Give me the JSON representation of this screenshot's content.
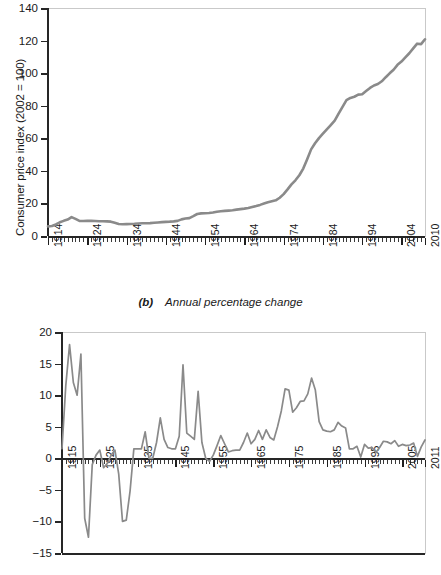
{
  "figure": {
    "panel_b_caption_prefix": "(b)",
    "panel_b_caption_text": "Annual percentage change",
    "line_color": "#8a8a8a",
    "axis_color": "#262626",
    "frame_color": "#c9c9c9"
  },
  "chart_data": [
    {
      "type": "line",
      "panel": "a",
      "title": "",
      "xlabel": "",
      "ylabel": "Consumer price index (2002 = 100)",
      "xlim": [
        1914,
        2010
      ],
      "ylim": [
        0,
        140
      ],
      "ytick_values": [
        0,
        20,
        40,
        60,
        80,
        100,
        120,
        140
      ],
      "ytick_labels": [
        "0",
        "20",
        "40",
        "60",
        "80",
        "100",
        "120",
        "140"
      ],
      "xtick_values": [
        1914,
        1924,
        1934,
        1944,
        1954,
        1964,
        1974,
        1984,
        1994,
        2004,
        2010
      ],
      "xtick_labels": [
        "1914",
        "1924",
        "1934",
        "1944",
        "1954",
        "1964",
        "1974",
        "1984",
        "1994",
        "2004",
        "2010"
      ],
      "minor_xticks": "every year",
      "grid": false,
      "legend": "none",
      "x": [
        1914,
        1915,
        1916,
        1917,
        1918,
        1919,
        1920,
        1921,
        1922,
        1923,
        1924,
        1925,
        1926,
        1927,
        1928,
        1929,
        1930,
        1931,
        1932,
        1933,
        1934,
        1935,
        1936,
        1937,
        1938,
        1939,
        1940,
        1941,
        1942,
        1943,
        1944,
        1945,
        1946,
        1947,
        1948,
        1949,
        1950,
        1951,
        1952,
        1953,
        1954,
        1955,
        1956,
        1957,
        1958,
        1959,
        1960,
        1961,
        1962,
        1963,
        1964,
        1965,
        1966,
        1967,
        1968,
        1969,
        1970,
        1971,
        1972,
        1973,
        1974,
        1975,
        1976,
        1977,
        1978,
        1979,
        1980,
        1981,
        1982,
        1983,
        1984,
        1985,
        1986,
        1987,
        1988,
        1989,
        1990,
        1991,
        1992,
        1993,
        1994,
        1995,
        1996,
        1997,
        1998,
        1999,
        2000,
        2001,
        2002,
        2003,
        2004,
        2005,
        2006,
        2007,
        2008,
        2009,
        2010
      ],
      "y": [
        5.9,
        6.1,
        7.1,
        8.4,
        9.3,
        10.1,
        11.6,
        10.5,
        9.3,
        9.2,
        9.3,
        9.3,
        9.2,
        9.1,
        9.1,
        9.0,
        8.8,
        8.1,
        7.4,
        7.2,
        7.3,
        7.4,
        7.5,
        7.7,
        7.8,
        7.8,
        7.9,
        8.1,
        8.3,
        8.5,
        8.7,
        8.8,
        9.0,
        9.3,
        10.2,
        10.7,
        11.0,
        12.2,
        13.5,
        13.9,
        14.0,
        14.1,
        14.4,
        14.9,
        15.2,
        15.4,
        15.6,
        15.8,
        16.2,
        16.5,
        16.8,
        17.2,
        17.8,
        18.4,
        19.1,
        19.9,
        20.7,
        21.3,
        21.9,
        23.5,
        25.7,
        28.6,
        31.7,
        34.2,
        37.3,
        41.4,
        47.2,
        53.2,
        56.9,
        60.1,
        62.8,
        65.4,
        68.1,
        70.8,
        75.1,
        79.3,
        83.4,
        84.8,
        85.5,
        86.8,
        87.0,
        89.0,
        90.9,
        92.4,
        93.3,
        95.0,
        97.5,
        99.9,
        102.1,
        105.1,
        107.1,
        109.7,
        112.2,
        115.2,
        118.1,
        117.8,
        120.8
      ]
    },
    {
      "type": "line",
      "panel": "b",
      "title": "(b) Annual percentage change",
      "xlabel": "",
      "ylabel": "Annual change in CPI",
      "xlim": [
        1915,
        2011
      ],
      "ylim": [
        -15,
        20
      ],
      "ytick_values": [
        -15,
        -10,
        -5,
        0,
        5,
        10,
        15,
        20
      ],
      "ytick_labels": [
        "−15",
        "−10",
        "−5",
        "0",
        "5",
        "10",
        "15",
        "20"
      ],
      "xtick_values": [
        1915,
        1925,
        1935,
        1945,
        1955,
        1965,
        1975,
        1985,
        1995,
        2005,
        2011
      ],
      "xtick_labels": [
        "1915",
        "1925",
        "1935",
        "1945",
        "1955",
        "1965",
        "1975",
        "1985",
        "1995",
        "2005",
        "2011"
      ],
      "minor_xticks": "every year",
      "grid": false,
      "legend": "none",
      "x": [
        1915,
        1916,
        1917,
        1918,
        1919,
        1920,
        1921,
        1922,
        1923,
        1924,
        1925,
        1926,
        1927,
        1928,
        1929,
        1930,
        1931,
        1932,
        1933,
        1934,
        1935,
        1936,
        1937,
        1938,
        1939,
        1940,
        1941,
        1942,
        1943,
        1944,
        1945,
        1946,
        1947,
        1948,
        1949,
        1950,
        1951,
        1952,
        1953,
        1954,
        1955,
        1956,
        1957,
        1958,
        1959,
        1960,
        1961,
        1962,
        1963,
        1964,
        1965,
        1966,
        1967,
        1968,
        1969,
        1970,
        1971,
        1972,
        1973,
        1974,
        1975,
        1976,
        1977,
        1978,
        1979,
        1980,
        1981,
        1982,
        1983,
        1984,
        1985,
        1986,
        1987,
        1988,
        1989,
        1990,
        1991,
        1992,
        1993,
        1994,
        1995,
        1996,
        1997,
        1998,
        1999,
        2000,
        2001,
        2002,
        2003,
        2004,
        2005,
        2006,
        2007,
        2008,
        2009,
        2010,
        2011
      ],
      "y": [
        1.5,
        11.5,
        18.0,
        12.0,
        10.0,
        16.5,
        -9.5,
        -12.5,
        -1.0,
        0.5,
        1.3,
        -1.5,
        -0.8,
        0.5,
        1.3,
        -2.5,
        -10.0,
        -9.8,
        -5.2,
        1.5,
        1.5,
        1.5,
        4.2,
        0.0,
        0.0,
        2.5,
        6.4,
        3.0,
        1.7,
        1.5,
        1.5,
        3.5,
        14.8,
        4.0,
        3.5,
        3.0,
        10.6,
        2.5,
        0.0,
        -0.5,
        0.5,
        2.0,
        3.6,
        2.3,
        1.0,
        1.2,
        1.3,
        1.3,
        2.5,
        4.0,
        2.3,
        3.0,
        4.4,
        3.0,
        4.5,
        3.3,
        2.9,
        5.0,
        7.5,
        11.0,
        10.8,
        7.3,
        8.0,
        9.0,
        9.1,
        10.2,
        12.7,
        10.8,
        5.8,
        4.5,
        4.3,
        4.2,
        4.5,
        5.7,
        5.1,
        4.8,
        1.5,
        1.5,
        1.9,
        0.2,
        2.2,
        1.6,
        1.7,
        0.9,
        1.7,
        2.7,
        2.6,
        2.3,
        2.8,
        1.9,
        2.2,
        2.0,
        2.1,
        2.4,
        0.3,
        1.8,
        2.9,
        1.5,
        2.3
      ]
    }
  ]
}
